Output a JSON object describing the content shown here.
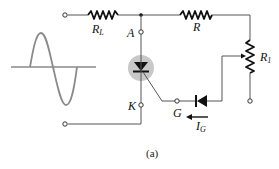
{
  "figure": {
    "caption": "(a)",
    "colors": {
      "wire": "#555555",
      "component": "#111111",
      "scr_halo": "#c8c8c8",
      "source_wave": "#8a8a8a",
      "background": "#ffffff"
    }
  },
  "labels": {
    "load_resistor": {
      "main": "R",
      "sub": "L"
    },
    "resistor": {
      "main": "R",
      "sub": ""
    },
    "potentiometer": {
      "main": "R",
      "sub": "1"
    },
    "anode": "A",
    "cathode": "K",
    "gate": "G",
    "gate_current": {
      "main": "I",
      "sub": "G"
    }
  },
  "components": [
    {
      "id": "ac-source",
      "type": "sine-wave-source"
    },
    {
      "id": "RL",
      "type": "resistor",
      "label": "RL"
    },
    {
      "id": "R",
      "type": "resistor",
      "label": "R"
    },
    {
      "id": "R1",
      "type": "potentiometer",
      "label": "R1"
    },
    {
      "id": "SCR",
      "type": "silicon-controlled-rectifier",
      "terminals": [
        "A",
        "K",
        "G"
      ]
    },
    {
      "id": "D",
      "type": "diode",
      "direction": "left"
    }
  ]
}
